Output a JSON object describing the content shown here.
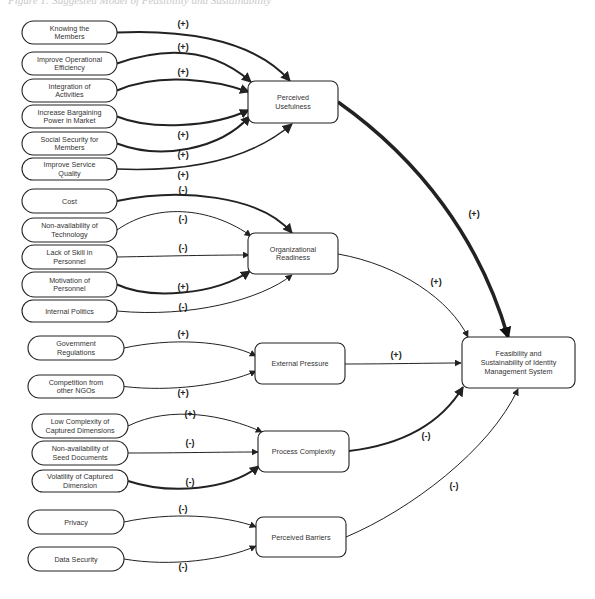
{
  "caption": "Figure 1: Suggested Model of Feasibility and Sustainability",
  "constructs": [
    {
      "id": "pu",
      "label": [
        "Perceived",
        "Usefulness"
      ],
      "x": 248,
      "y": 81,
      "w": 90,
      "h": 42
    },
    {
      "id": "or",
      "label": [
        "Organizational",
        "Readiness"
      ],
      "x": 248,
      "y": 233,
      "w": 90,
      "h": 41
    },
    {
      "id": "ep",
      "label": [
        "External Pressure"
      ],
      "x": 255,
      "y": 343,
      "w": 90,
      "h": 41
    },
    {
      "id": "pc",
      "label": [
        "Process Complexity"
      ],
      "x": 258,
      "y": 431,
      "w": 91,
      "h": 41
    },
    {
      "id": "pb",
      "label": [
        "Perceived Barriers"
      ],
      "x": 256,
      "y": 517,
      "w": 90,
      "h": 40
    },
    {
      "id": "fs",
      "label": [
        "Feasibility and",
        "Sustainability of Identity",
        "Management System"
      ],
      "x": 462,
      "y": 337,
      "w": 113,
      "h": 51
    }
  ],
  "factors": [
    {
      "id": "f1",
      "label": [
        "Knowing the",
        "Members"
      ],
      "x": 22,
      "y": 21,
      "w": 95,
      "h": 23,
      "target": "pu",
      "sign": "(+)",
      "signX": 183,
      "signY": 27,
      "weight": 2,
      "end": [
        290,
        81
      ],
      "c1": [
        170,
        30
      ],
      "c2": [
        250,
        35
      ]
    },
    {
      "id": "f2",
      "label": [
        "Improve Operational",
        "Efficiency"
      ],
      "x": 22,
      "y": 52,
      "w": 95,
      "h": 23,
      "target": "pu",
      "sign": "(+)",
      "signX": 183,
      "signY": 50,
      "weight": 2,
      "end": [
        251,
        82
      ],
      "c1": [
        170,
        45
      ],
      "c2": [
        215,
        50
      ]
    },
    {
      "id": "f3",
      "label": [
        "Integration of",
        "Activities"
      ],
      "x": 22,
      "y": 79,
      "w": 95,
      "h": 23,
      "target": "pu",
      "sign": "(+)",
      "signX": 183,
      "signY": 75,
      "weight": 2,
      "end": [
        249,
        92
      ],
      "c1": [
        160,
        72
      ],
      "c2": [
        215,
        80
      ]
    },
    {
      "id": "f4",
      "label": [
        "Increase Bargaining",
        "Power in Market"
      ],
      "x": 22,
      "y": 105,
      "w": 95,
      "h": 23,
      "target": "pu",
      "sign": "(+)",
      "signX": 183,
      "signY": 138,
      "weight": 2,
      "end": [
        249,
        110
      ],
      "c1": [
        150,
        130
      ],
      "c2": [
        210,
        128
      ]
    },
    {
      "id": "f5",
      "label": [
        "Social Security for",
        "Members"
      ],
      "x": 22,
      "y": 132,
      "w": 95,
      "h": 23,
      "target": "pu",
      "sign": "(+)",
      "signX": 183,
      "signY": 158,
      "weight": 2,
      "end": [
        250,
        116
      ],
      "c1": [
        160,
        160
      ],
      "c2": [
        220,
        150
      ]
    },
    {
      "id": "f6",
      "label": [
        "Improve Service",
        "Quality"
      ],
      "x": 22,
      "y": 158,
      "w": 95,
      "h": 22,
      "target": "pu",
      "sign": "(+)",
      "signX": 183,
      "signY": 178,
      "weight": 1.5,
      "end": [
        292,
        124
      ],
      "c1": [
        190,
        172
      ],
      "c2": [
        250,
        160
      ]
    },
    {
      "id": "f7",
      "label": [
        "Cost"
      ],
      "x": 22,
      "y": 189,
      "w": 95,
      "h": 24,
      "target": "or",
      "sign": "(-)",
      "signX": 183,
      "signY": 193,
      "weight": 2,
      "end": [
        292,
        233
      ],
      "c1": [
        180,
        188
      ],
      "c2": [
        260,
        195
      ]
    },
    {
      "id": "f8",
      "label": [
        "Non-availability of",
        "Technology"
      ],
      "x": 22,
      "y": 218,
      "w": 95,
      "h": 24,
      "target": "or",
      "sign": "(-)",
      "signX": 183,
      "signY": 222,
      "weight": 1,
      "end": [
        251,
        236
      ],
      "c1": [
        160,
        200
      ],
      "c2": [
        215,
        210
      ]
    },
    {
      "id": "f9",
      "label": [
        "Lack of Skill in",
        "Personnel"
      ],
      "x": 22,
      "y": 245,
      "w": 95,
      "h": 24,
      "target": "or",
      "sign": "(-)",
      "signX": 183,
      "signY": 251,
      "weight": 1,
      "end": [
        249,
        255
      ],
      "c1": [
        170,
        256
      ],
      "c2": [
        210,
        255
      ]
    },
    {
      "id": "f10",
      "label": [
        "Motivation of",
        "Personnel"
      ],
      "x": 22,
      "y": 272,
      "w": 95,
      "h": 25,
      "target": "or",
      "sign": "(+)",
      "signX": 183,
      "signY": 290,
      "weight": 2,
      "end": [
        250,
        271
      ],
      "c1": [
        150,
        300
      ],
      "c2": [
        215,
        295
      ]
    },
    {
      "id": "f11",
      "label": [
        "Internal Politics"
      ],
      "x": 22,
      "y": 300,
      "w": 95,
      "h": 22,
      "target": "or",
      "sign": "(-)",
      "signX": 183,
      "signY": 310,
      "weight": 1,
      "end": [
        292,
        275
      ],
      "c1": [
        190,
        318
      ],
      "c2": [
        260,
        300
      ]
    },
    {
      "id": "f12",
      "label": [
        "Government",
        "Regulations"
      ],
      "x": 28,
      "y": 336,
      "w": 96,
      "h": 24,
      "target": "ep",
      "sign": "(+)",
      "signX": 183,
      "signY": 337,
      "weight": 1,
      "end": [
        256,
        356
      ],
      "c1": [
        170,
        338
      ],
      "c2": [
        225,
        340
      ]
    },
    {
      "id": "f13",
      "label": [
        "Competition from",
        "other NGOs"
      ],
      "x": 28,
      "y": 375,
      "w": 96,
      "h": 23,
      "target": "ep",
      "sign": "(+)",
      "signX": 183,
      "signY": 396,
      "weight": 1,
      "end": [
        256,
        371
      ],
      "c1": [
        170,
        392
      ],
      "c2": [
        225,
        385
      ]
    },
    {
      "id": "f14",
      "label": [
        "Low Complexity of",
        "Captured Dimensions"
      ],
      "x": 32,
      "y": 414,
      "w": 96,
      "h": 24,
      "target": "pc",
      "sign": "(+)",
      "signX": 190,
      "signY": 417,
      "weight": 1,
      "end": [
        262,
        432
      ],
      "c1": [
        170,
        405
      ],
      "c2": [
        225,
        415
      ]
    },
    {
      "id": "f15",
      "label": [
        "Non-availability of",
        "Seed Documents"
      ],
      "x": 32,
      "y": 441,
      "w": 96,
      "h": 24,
      "target": "pc",
      "sign": "(-)",
      "signX": 190,
      "signY": 446,
      "weight": 1,
      "end": [
        258,
        452
      ],
      "c1": [
        180,
        453
      ],
      "c2": [
        220,
        452
      ]
    },
    {
      "id": "f16",
      "label": [
        "Volatility of Captured",
        "Dimension"
      ],
      "x": 32,
      "y": 470,
      "w": 96,
      "h": 22,
      "target": "pc",
      "sign": "(-)",
      "signX": 190,
      "signY": 485,
      "weight": 2,
      "end": [
        259,
        466
      ],
      "c1": [
        170,
        495
      ],
      "c2": [
        230,
        490
      ]
    },
    {
      "id": "f17",
      "label": [
        "Privacy"
      ],
      "x": 28,
      "y": 510,
      "w": 96,
      "h": 24,
      "target": "pb",
      "sign": "(-)",
      "signX": 183,
      "signY": 512,
      "weight": 1,
      "end": [
        256,
        527
      ],
      "c1": [
        170,
        512
      ],
      "c2": [
        225,
        515
      ]
    },
    {
      "id": "f18",
      "label": [
        "Data Security"
      ],
      "x": 28,
      "y": 547,
      "w": 96,
      "h": 24,
      "target": "pb",
      "sign": "(-)",
      "signX": 183,
      "signY": 570,
      "weight": 1,
      "end": [
        256,
        546
      ],
      "c1": [
        170,
        567
      ],
      "c2": [
        225,
        560
      ]
    }
  ],
  "paths": [
    {
      "from": "pu",
      "sign": "(+)",
      "signX": 474,
      "signY": 217,
      "weight": 3.5,
      "start": [
        338,
        102
      ],
      "end": [
        508,
        337
      ],
      "c1": [
        420,
        160
      ],
      "c2": [
        480,
        240
      ]
    },
    {
      "from": "or",
      "sign": "(+)",
      "signX": 436,
      "signY": 285,
      "weight": 1,
      "start": [
        338,
        254
      ],
      "end": [
        468,
        337
      ],
      "c1": [
        400,
        265
      ],
      "c2": [
        450,
        300
      ]
    },
    {
      "from": "ep",
      "sign": "(+)",
      "signX": 396,
      "signY": 358,
      "weight": 1,
      "start": [
        345,
        364
      ],
      "end": [
        461,
        363
      ],
      "c1": [
        390,
        364
      ],
      "c2": [
        430,
        363
      ]
    },
    {
      "from": "pc",
      "sign": "(-)",
      "signX": 426,
      "signY": 439,
      "weight": 2,
      "start": [
        349,
        451
      ],
      "end": [
        463,
        387
      ],
      "c1": [
        400,
        445
      ],
      "c2": [
        440,
        425
      ]
    },
    {
      "from": "pb",
      "sign": "(-)",
      "signX": 454,
      "signY": 489,
      "weight": 1,
      "start": [
        346,
        537
      ],
      "end": [
        518,
        389
      ],
      "c1": [
        410,
        510
      ],
      "c2": [
        490,
        450
      ]
    }
  ],
  "colors": {
    "stroke": "#222222",
    "box_fill": "#ffffff",
    "text": "#333333"
  }
}
